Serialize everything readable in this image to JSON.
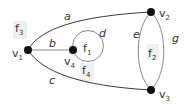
{
  "diagram": {
    "type": "planar-graph",
    "vertices": [
      {
        "id": "v1",
        "label": "v",
        "sub": "1",
        "x": 28,
        "y": 50
      },
      {
        "id": "v2",
        "label": "v",
        "sub": "2",
        "x": 151,
        "y": 12
      },
      {
        "id": "v3",
        "label": "v",
        "sub": "3",
        "x": 151,
        "y": 90
      },
      {
        "id": "v4",
        "label": "v",
        "sub": "4",
        "x": 73,
        "y": 50
      }
    ],
    "edges": [
      {
        "id": "a",
        "label": "a",
        "from": "v1",
        "to": "v2"
      },
      {
        "id": "b",
        "label": "b",
        "from": "v1",
        "to": "v4"
      },
      {
        "id": "c",
        "label": "c",
        "from": "v1",
        "to": "v3"
      },
      {
        "id": "d",
        "label": "d",
        "from": "v4",
        "to": "v4",
        "loop": true
      },
      {
        "id": "e",
        "label": "e",
        "from": "v2",
        "to": "v3"
      },
      {
        "id": "g",
        "label": "g",
        "from": "v2",
        "to": "v3"
      }
    ],
    "faces": [
      {
        "id": "f1",
        "label": "f",
        "sub": "1"
      },
      {
        "id": "f2",
        "label": "f",
        "sub": "2"
      },
      {
        "id": "f3",
        "label": "f",
        "sub": "3"
      },
      {
        "id": "f4",
        "label": "f",
        "sub": "4"
      }
    ]
  }
}
